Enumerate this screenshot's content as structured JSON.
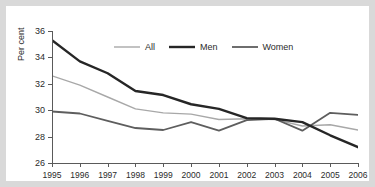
{
  "chart_data": {
    "type": "line",
    "title": "",
    "subtitle": "",
    "xlabel": "",
    "ylabel": "Per cent",
    "x": [
      1995,
      1996,
      1997,
      1998,
      1999,
      2000,
      2001,
      2002,
      2003,
      2004,
      2005,
      2006
    ],
    "categories": [
      "1995",
      "1996",
      "1997",
      "1998",
      "1999",
      "2000",
      "2001",
      "2002",
      "2003",
      "2004",
      "2005",
      "2006"
    ],
    "xlim": [
      1995,
      2006
    ],
    "ylim": [
      26,
      36
    ],
    "yticks": [
      26,
      28,
      30,
      32,
      34,
      36
    ],
    "ytick_labels": [
      "26",
      "28",
      "30",
      "32",
      "34",
      "36"
    ],
    "grid": false,
    "legend_position": "top-center",
    "series": [
      {
        "name": "All",
        "color": "#a8a8a8",
        "width": 1.4,
        "values": [
          32.6,
          31.9,
          31.0,
          30.1,
          29.8,
          29.7,
          29.3,
          29.35,
          29.3,
          28.8,
          28.9,
          28.5
        ]
      },
      {
        "name": "Men",
        "color": "#262626",
        "width": 2.4,
        "values": [
          35.3,
          33.7,
          32.8,
          31.45,
          31.15,
          30.45,
          30.1,
          29.4,
          29.35,
          29.1,
          28.1,
          27.2
        ]
      },
      {
        "name": "Women",
        "color": "#5e5e5e",
        "width": 1.8,
        "values": [
          29.9,
          29.75,
          29.2,
          28.65,
          28.5,
          29.1,
          28.45,
          29.25,
          29.35,
          28.45,
          29.8,
          29.65
        ]
      }
    ]
  },
  "legend": {
    "items": [
      {
        "label": "All"
      },
      {
        "label": "Men"
      },
      {
        "label": "Women"
      }
    ]
  },
  "axes": {
    "y_label": "Per cent"
  }
}
